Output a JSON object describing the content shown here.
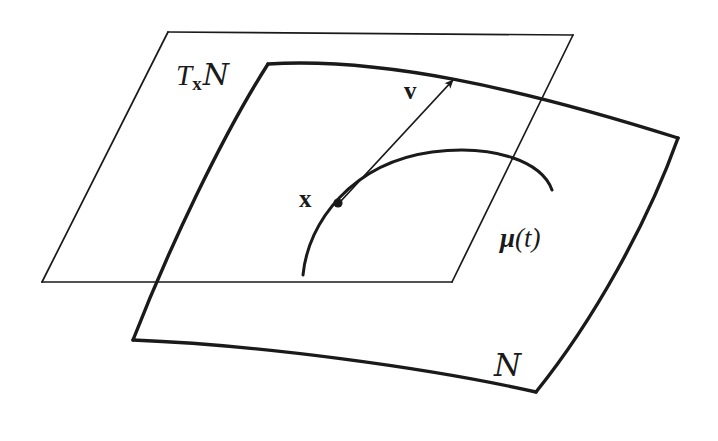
{
  "figure": {
    "background_color": "#ffffff",
    "ink_color": "#1a1a1a",
    "width": 718,
    "height": 441
  },
  "labels": {
    "tangent_space": {
      "text": "T_xN",
      "base": "T",
      "subscript": "x",
      "manifold": "N"
    },
    "tangent_vector": {
      "text": "v"
    },
    "base_point": {
      "text": "x"
    },
    "curve": {
      "text": "μ(t)",
      "symbol": "μ",
      "open_paren": "(",
      "parameter": "t",
      "close_paren": ")"
    },
    "manifold": {
      "text": "N"
    }
  },
  "geometry": {
    "tangent_plane": {
      "name": "tangent-plane-parallelogram",
      "stroke_width": 1.6,
      "corners": [
        [
          168,
          32
        ],
        [
          573,
          35
        ],
        [
          452,
          282
        ],
        [
          42,
          282
        ]
      ]
    },
    "manifold_patch": {
      "name": "manifold-surface-patch",
      "stroke_width": 3.4,
      "corners": [
        [
          268,
          64
        ],
        [
          678,
          138
        ],
        [
          536,
          392
        ],
        [
          133,
          340
        ]
      ]
    },
    "curve_mu": {
      "name": "curve-mu-of-t",
      "stroke_width": 3.0,
      "start": [
        303,
        275
      ],
      "peak": [
        450,
        152
      ],
      "end": [
        552,
        190
      ]
    },
    "tangent_vector_arrow": {
      "name": "tangent-vector-arrow",
      "stroke_width": 1.6,
      "tail": [
        340,
        202
      ],
      "head": [
        456,
        77
      ]
    },
    "base_point_dot": {
      "name": "base-point-dot",
      "center": [
        338,
        203
      ],
      "radius": 4.4
    }
  }
}
